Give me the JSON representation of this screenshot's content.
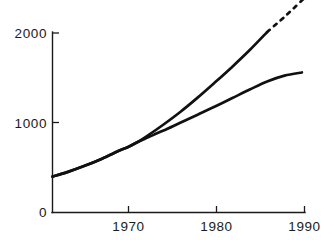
{
  "chart_data": {
    "type": "line",
    "title": "",
    "subtitle": "",
    "xlabel": "",
    "ylabel": "",
    "xlim": [
      1961.3,
      1990.3
    ],
    "ylim": [
      0,
      2100
    ],
    "grid": false,
    "legend": "none",
    "x_ticks": [
      1970,
      1980,
      1990
    ],
    "x_tick_labels": [
      "1970",
      "1980",
      "1990"
    ],
    "y_ticks": [
      0,
      1000,
      2000
    ],
    "y_tick_labels": [
      "0",
      "1000",
      "2000"
    ],
    "series": [
      {
        "name": "upper-curve",
        "style": "solid",
        "x": [
          1961.3,
          1963,
          1965,
          1967,
          1969,
          1970,
          1971,
          1972,
          1974,
          1976,
          1978,
          1980,
          1982,
          1984,
          1986
        ],
        "values": [
          400,
          450,
          520,
          600,
          690,
          730,
          780,
          840,
          975,
          1120,
          1280,
          1450,
          1625,
          1810,
          2010
        ]
      },
      {
        "name": "upper-curve-projection",
        "style": "dashed",
        "x": [
          1986,
          1987,
          1988,
          1989,
          1990.3
        ],
        "values": [
          2010,
          2095,
          2180,
          2270,
          2390
        ]
      },
      {
        "name": "lower-curve",
        "style": "solid",
        "x": [
          1961.3,
          1963,
          1965,
          1967,
          1969,
          1970,
          1971,
          1972,
          1974,
          1976,
          1978,
          1980,
          1982,
          1984,
          1986,
          1988,
          1990
        ],
        "values": [
          400,
          450,
          520,
          600,
          690,
          730,
          780,
          825,
          910,
          1000,
          1090,
          1180,
          1275,
          1370,
          1460,
          1525,
          1560
        ]
      }
    ],
    "annotations": [
      {
        "name": "divergence-point",
        "x": 1971.5,
        "y": 805,
        "note": "two curves coincide before this point and separate after"
      }
    ],
    "colors": {
      "background": "#ffffff",
      "axis": "#1a1a1a",
      "series": "#111111"
    }
  },
  "axes": {
    "y_labels": [
      "2000",
      "1000",
      "0"
    ],
    "x_labels": [
      "1970",
      "1980",
      "1990"
    ]
  }
}
